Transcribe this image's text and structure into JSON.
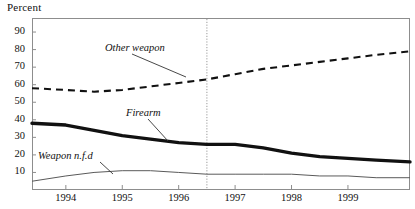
{
  "axis": {
    "y_title": "Percent",
    "y_ticks": [
      90,
      80,
      70,
      60,
      50,
      40,
      30,
      20,
      10
    ],
    "x_ticks": [
      "1994",
      "1995",
      "1996",
      "1997",
      "1998",
      "1999"
    ]
  },
  "annotations": {
    "other_weapon": "Other weapon",
    "firearm": "Firearm",
    "weapon_nfd": "Weapon n.f.d"
  },
  "colors": {
    "line": "#111111",
    "frame": "#8d8d8d",
    "thin_line": "#5a5a5a",
    "divider": "#9a9a9a"
  },
  "chart_data": {
    "type": "line",
    "title": "",
    "xlabel": "",
    "ylabel": "Percent",
    "ylim": [
      0,
      98
    ],
    "xlim": [
      1993.4,
      2000.1
    ],
    "grid": false,
    "legend": "inline-annotations",
    "x_tick_values": [
      1994,
      1995,
      1996,
      1997,
      1998,
      1999
    ],
    "x_tick_labels": [
      "1994",
      "1995",
      "1996",
      "1997",
      "1998",
      "1999"
    ],
    "y_tick_values": [
      10,
      20,
      30,
      40,
      50,
      60,
      70,
      80,
      90
    ],
    "vertical_divider_x": 1996.5,
    "series": [
      {
        "name": "Other weapon",
        "style": "dashed",
        "x": [
          1993.4,
          1994.0,
          1994.5,
          1995.0,
          1995.5,
          1996.0,
          1996.5,
          1997.0,
          1997.5,
          1998.0,
          1998.5,
          1999.0,
          1999.5,
          2000.1
        ],
        "values": [
          58,
          57,
          56,
          57,
          59,
          61,
          63,
          66,
          69,
          71,
          73,
          75,
          77,
          79
        ]
      },
      {
        "name": "Firearm",
        "style": "thick-solid",
        "x": [
          1993.4,
          1994.0,
          1994.5,
          1995.0,
          1995.5,
          1996.0,
          1996.5,
          1997.0,
          1997.5,
          1998.0,
          1998.5,
          1999.0,
          1999.5,
          2000.1
        ],
        "values": [
          38,
          37,
          34,
          31,
          29,
          27,
          26,
          26,
          24,
          21,
          19,
          18,
          17,
          16
        ]
      },
      {
        "name": "Weapon n.f.d",
        "style": "thin-solid",
        "x": [
          1993.4,
          1994.0,
          1994.5,
          1995.0,
          1995.5,
          1996.0,
          1996.5,
          1997.0,
          1997.5,
          1998.0,
          1998.5,
          1999.0,
          1999.5,
          2000.1
        ],
        "values": [
          5,
          8,
          10,
          11,
          11,
          10,
          9,
          9,
          9,
          9,
          8,
          8,
          7,
          7
        ]
      }
    ]
  }
}
